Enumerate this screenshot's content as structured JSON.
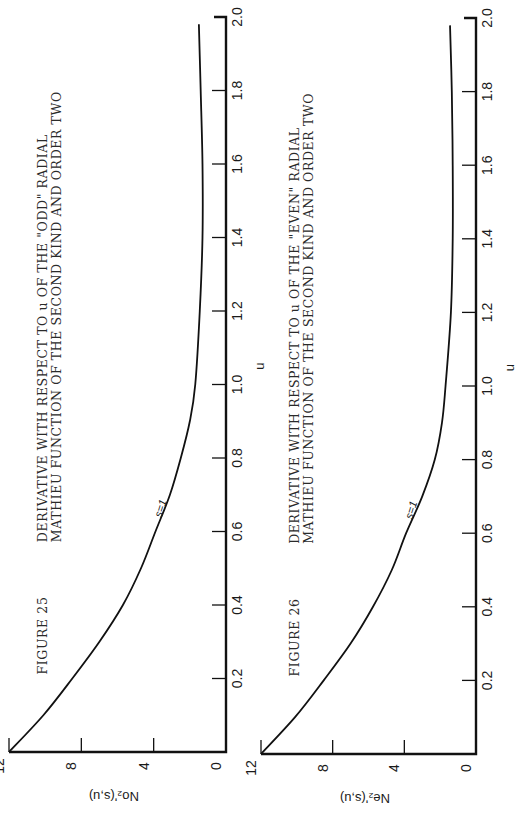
{
  "chart_data": [
    {
      "type": "line",
      "figure": "FIGURE 25",
      "title": "DERIVATIVE WITH RESPECT TO u OF THE \"ODD\" RADIAL MATHIEU FUNCTION OF THE SECOND KIND AND ORDER TWO",
      "title_lines": [
        "DERIVATIVE WITH RESPECT TO u OF THE \"ODD\" RADIAL",
        "MATHIEU FUNCTION OF THE SECOND KIND AND ORDER TWO"
      ],
      "xlabel": "u",
      "ylabel": "No₂'(s,u)",
      "xlim": [
        0,
        2.0
      ],
      "ylim": [
        0,
        12
      ],
      "x_ticks": [
        "0",
        "0.2",
        "0.4",
        "0.6",
        "0.8",
        "1.0",
        "1.2",
        "1.4",
        "1.6",
        "1.8",
        "2.0"
      ],
      "y_ticks": [
        "0",
        "4",
        "8",
        "12"
      ],
      "grid": false,
      "orientation": "rotated 90° counter-clockwise on page",
      "series": [
        {
          "name": "s=1",
          "x": [
            0,
            0.1,
            0.2,
            0.3,
            0.4,
            0.5,
            0.6,
            0.7,
            0.8,
            0.9,
            1.0,
            1.2,
            1.4,
            1.6,
            1.8,
            1.98
          ],
          "values": [
            12.0,
            10.1,
            8.5,
            7.0,
            5.7,
            4.7,
            3.9,
            3.1,
            2.5,
            2.0,
            1.7,
            1.45,
            1.3,
            1.3,
            1.4,
            1.5
          ]
        }
      ]
    },
    {
      "type": "line",
      "figure": "FIGURE 26",
      "title": "DERIVATIVE WITH RESPECT TO u OF THE \"EVEN\" RADIAL MATHIEU FUNCTION OF THE SECOND KIND AND ORDER TWO",
      "title_lines": [
        "DERIVATIVE WITH RESPECT TO u OF THE \"EVEN\" RADIAL",
        "MATHIEU FUNCTION OF THE SECOND KIND AND ORDER TWO"
      ],
      "xlabel": "u",
      "ylabel": "Ne₂'(s,u)",
      "xlim": [
        0,
        2.0
      ],
      "ylim": [
        0,
        12
      ],
      "x_ticks": [
        "0",
        "0.2",
        "0.4",
        "0.6",
        "0.8",
        "1.0",
        "1.2",
        "1.4",
        "1.6",
        "1.8",
        "2.0"
      ],
      "y_ticks": [
        "0",
        "4",
        "8",
        "12"
      ],
      "grid": false,
      "orientation": "rotated 90° counter-clockwise on page",
      "series": [
        {
          "name": "s=1",
          "x": [
            0,
            0.1,
            0.2,
            0.3,
            0.4,
            0.5,
            0.6,
            0.7,
            0.8,
            0.9,
            1.0,
            1.2,
            1.4,
            1.6,
            1.8,
            1.98
          ],
          "values": [
            12.0,
            10.1,
            8.5,
            7.0,
            5.75,
            4.7,
            3.9,
            3.0,
            2.3,
            1.9,
            1.7,
            1.4,
            1.3,
            1.3,
            1.35,
            1.45
          ]
        }
      ]
    }
  ]
}
